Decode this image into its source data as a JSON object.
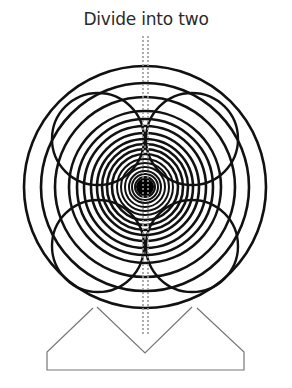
{
  "title": "Divide into two",
  "diagram": {
    "center": [
      145,
      187
    ],
    "concentric_radii": [
      121,
      104,
      90,
      76,
      68,
      61,
      54,
      48,
      43,
      38,
      33,
      28,
      24,
      20,
      16,
      13,
      10,
      7,
      4
    ],
    "lobe_circles": [
      {
        "cx": 98,
        "cy": 139,
        "r": 46
      },
      {
        "cx": 192,
        "cy": 139,
        "r": 46
      },
      {
        "cx": 98,
        "cy": 246,
        "r": 46
      },
      {
        "cx": 192,
        "cy": 246,
        "r": 46
      }
    ],
    "divider_line_x": [
      143,
      148
    ],
    "divider_line_y": [
      36,
      335
    ],
    "base_outline": "M93,308 L47,352 L47,370 L244,370 L244,352 L197,308 M97,307 L145,353 L192,307",
    "colors": {
      "ring": "#111111",
      "base": "#777777",
      "divider": "#999999",
      "text": "#2a2a2a"
    }
  }
}
